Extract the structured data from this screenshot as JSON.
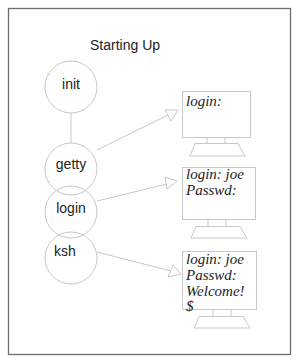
{
  "diagram": {
    "title": "Starting Up",
    "processes": [
      {
        "id": "init",
        "label": "init"
      },
      {
        "id": "getty",
        "label": "getty"
      },
      {
        "id": "login",
        "label": "login"
      },
      {
        "id": "ksh",
        "label": "ksh"
      }
    ],
    "terminals": [
      {
        "id": "terminal-1",
        "lines": [
          "login:"
        ]
      },
      {
        "id": "terminal-2",
        "lines": [
          "login: joe",
          "Passwd:"
        ]
      },
      {
        "id": "terminal-3",
        "lines": [
          "login: joe",
          "Passwd:",
          "Welcome!",
          "$"
        ]
      }
    ],
    "arrows": [
      {
        "from": "getty",
        "to": "terminal-1"
      },
      {
        "from": "login",
        "to": "terminal-2"
      },
      {
        "from": "ksh",
        "to": "terminal-3"
      }
    ],
    "colors": {
      "frame": "#6e6e6e",
      "lines": "#c8c8c8",
      "text": "#222222"
    }
  }
}
